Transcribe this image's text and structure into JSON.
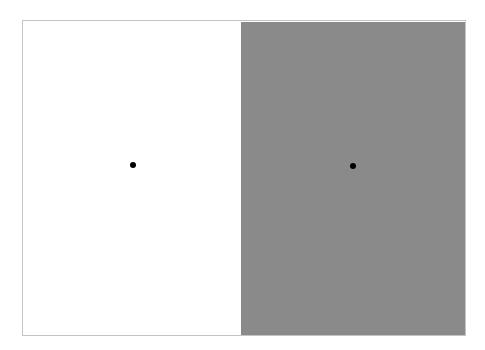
{
  "stimulus": {
    "panels": [
      {
        "name": "left",
        "background": "#ffffff",
        "fixation_dot": {
          "x": 110,
          "y": 144
        }
      },
      {
        "name": "right",
        "background": "#8a8a8a",
        "fixation_dot": {
          "x": 112,
          "y": 144
        }
      }
    ],
    "border_color": "#c4c4c4",
    "dot_color": "#000000"
  }
}
